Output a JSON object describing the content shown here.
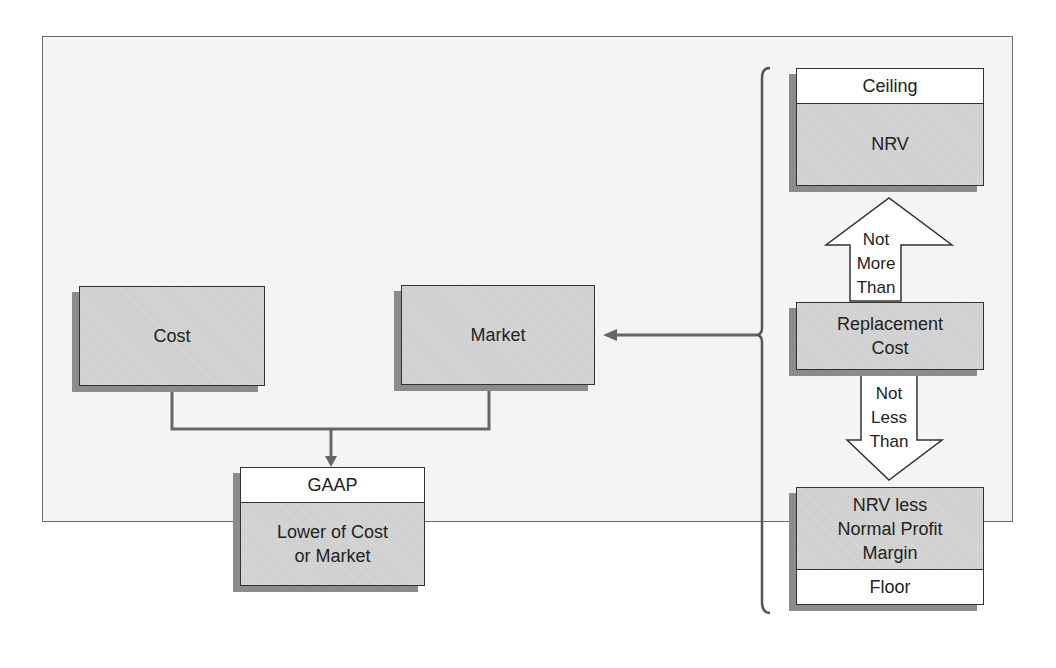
{
  "diagram": {
    "nodes": {
      "cost": {
        "label": "Cost"
      },
      "market": {
        "label": "Market"
      },
      "gaap": {
        "header": "GAAP",
        "label_line1": "Lower of Cost",
        "label_line2": "or Market"
      },
      "ceiling": {
        "header": "Ceiling",
        "label": "NRV"
      },
      "replacement": {
        "label_line1": "Replacement",
        "label_line2": "Cost"
      },
      "floor": {
        "label_line1": "NRV less",
        "label_line2": "Normal Profit",
        "label_line3": "Margin",
        "footer": "Floor"
      }
    },
    "arrows": {
      "up": {
        "line1": "Not",
        "line2": "More",
        "line3": "Than"
      },
      "down": {
        "line1": "Not",
        "line2": "Less",
        "line3": "Than"
      }
    },
    "colors": {
      "box_fill": "#cfcfcf",
      "shadow": "#8c8c8c",
      "border": "#333333",
      "connector": "#666666",
      "background": "#f4f4f4"
    }
  }
}
